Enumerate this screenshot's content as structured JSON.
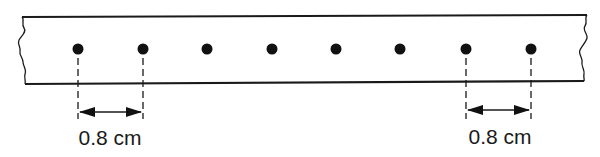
{
  "diagram": {
    "dot_count": 8,
    "dimensions": [
      {
        "label": "0.8 cm",
        "from_dot": 1,
        "to_dot": 2
      },
      {
        "label": "0.8 cm",
        "from_dot": 7,
        "to_dot": 8
      }
    ],
    "colors": {
      "stroke": "#1a1a1a",
      "background": "#ffffff"
    }
  }
}
